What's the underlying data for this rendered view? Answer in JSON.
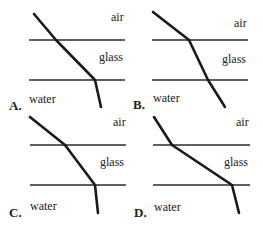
{
  "labels": {
    "air": "air",
    "glass": "glass",
    "water": "water"
  },
  "options": [
    {
      "letter": "A.",
      "ray_points": "34,14 56,40 95,80 101,107"
    },
    {
      "letter": "B.",
      "ray_points": "153,12 189,40 208,80 225,107"
    },
    {
      "letter": "C.",
      "ray_points": "30,117 65,145 95,185 98,213"
    },
    {
      "letter": "D.",
      "ray_points": "154,117 172,145 232,185 239,213"
    }
  ]
}
